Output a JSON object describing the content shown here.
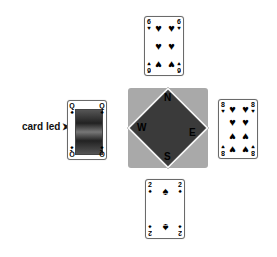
{
  "label": {
    "text": "card led",
    "arrow": "➤"
  },
  "compass": {
    "north": "N",
    "south": "S",
    "east": "E",
    "west": "W",
    "bg_color": "#a9a9a9",
    "diamond_color": "#3a3a3a"
  },
  "cards": {
    "north": {
      "rank": "6",
      "suit": "♥",
      "suit_name": "hearts"
    },
    "west": {
      "rank": "Q",
      "suit": "♠",
      "suit_name": "spades"
    },
    "east": {
      "rank": "8",
      "suit": "♥",
      "suit_name": "hearts"
    },
    "south": {
      "rank": "2",
      "suit": "♠",
      "suit_name": "spades"
    }
  }
}
